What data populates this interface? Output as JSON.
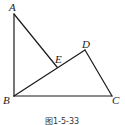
{
  "figure": {
    "caption": "图1-5-33",
    "points": {
      "A": {
        "label": "A",
        "x": 14,
        "y": 14
      },
      "B": {
        "label": "B",
        "x": 14,
        "y": 96
      },
      "C": {
        "label": "C",
        "x": 112,
        "y": 96
      },
      "D": {
        "label": "D",
        "x": 85,
        "y": 50
      },
      "E": {
        "label": "E",
        "x": 57,
        "y": 67
      }
    },
    "segments": [
      "AB",
      "AE",
      "BD",
      "BC",
      "CD"
    ],
    "colors": {
      "stroke": "#1a1a1a",
      "background": "#ffffff"
    }
  }
}
